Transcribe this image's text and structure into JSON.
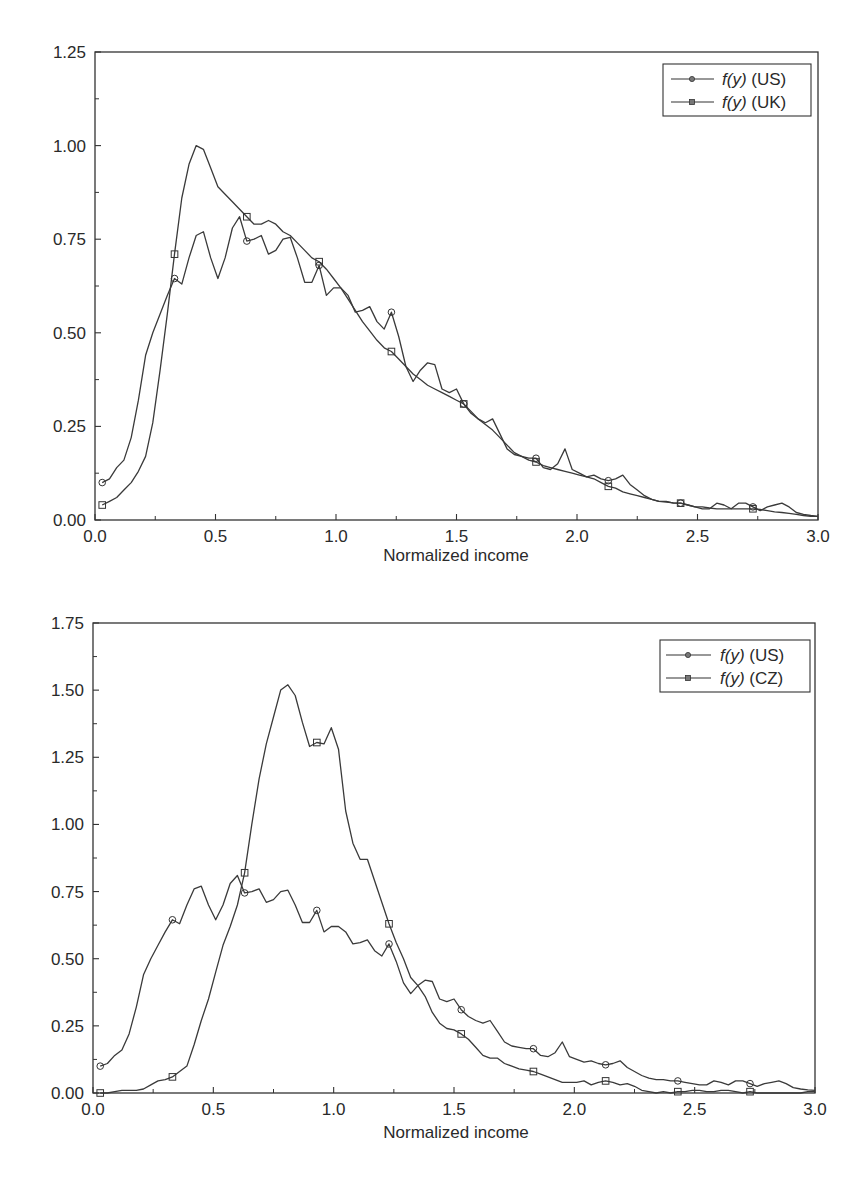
{
  "chart_data": [
    {
      "type": "line",
      "title": "",
      "xlabel": "Normalized income",
      "ylabel": "",
      "xlim": [
        0.0,
        3.0
      ],
      "ylim": [
        0.0,
        1.25
      ],
      "grid": false,
      "legend_position": "upper right",
      "x_ticks": [
        "0.0",
        "0.5",
        "1.0",
        "1.5",
        "2.0",
        "2.5",
        "3.0"
      ],
      "y_ticks": [
        "0.00",
        "0.25",
        "0.50",
        "0.75",
        "1.00",
        "1.25"
      ],
      "marker_x": [
        0.03,
        0.33,
        0.63,
        0.93,
        1.23,
        1.53,
        1.83,
        2.13,
        2.43,
        2.73
      ],
      "series": [
        {
          "name": "f(y) (US)",
          "legend_main": "f(y)",
          "legend_suffix": " (US)",
          "marker": "circle",
          "x": [
            0.03,
            0.06,
            0.09,
            0.12,
            0.15,
            0.18,
            0.21,
            0.24,
            0.27,
            0.3,
            0.33,
            0.36,
            0.39,
            0.42,
            0.45,
            0.48,
            0.51,
            0.54,
            0.57,
            0.6,
            0.63,
            0.66,
            0.69,
            0.72,
            0.75,
            0.78,
            0.81,
            0.84,
            0.87,
            0.9,
            0.93,
            0.96,
            0.99,
            1.02,
            1.05,
            1.08,
            1.11,
            1.14,
            1.17,
            1.2,
            1.23,
            1.26,
            1.29,
            1.32,
            1.35,
            1.38,
            1.41,
            1.44,
            1.47,
            1.5,
            1.53,
            1.56,
            1.59,
            1.62,
            1.65,
            1.68,
            1.71,
            1.74,
            1.77,
            1.8,
            1.83,
            1.86,
            1.89,
            1.92,
            1.95,
            1.98,
            2.01,
            2.04,
            2.07,
            2.1,
            2.13,
            2.16,
            2.19,
            2.22,
            2.25,
            2.28,
            2.31,
            2.34,
            2.37,
            2.4,
            2.43,
            2.46,
            2.49,
            2.52,
            2.55,
            2.58,
            2.61,
            2.64,
            2.67,
            2.7,
            2.73,
            2.76,
            2.79,
            2.82,
            2.85,
            2.88,
            2.91,
            2.94,
            2.97,
            3.0
          ],
          "values": [
            0.1,
            0.11,
            0.14,
            0.16,
            0.22,
            0.32,
            0.44,
            0.5,
            0.55,
            0.6,
            0.645,
            0.63,
            0.7,
            0.76,
            0.77,
            0.7,
            0.645,
            0.7,
            0.78,
            0.81,
            0.745,
            0.75,
            0.76,
            0.71,
            0.72,
            0.75,
            0.755,
            0.7,
            0.635,
            0.635,
            0.68,
            0.6,
            0.62,
            0.62,
            0.6,
            0.555,
            0.56,
            0.57,
            0.53,
            0.51,
            0.555,
            0.49,
            0.41,
            0.37,
            0.4,
            0.42,
            0.415,
            0.35,
            0.34,
            0.35,
            0.31,
            0.285,
            0.27,
            0.26,
            0.27,
            0.23,
            0.19,
            0.175,
            0.17,
            0.165,
            0.165,
            0.14,
            0.135,
            0.15,
            0.19,
            0.135,
            0.125,
            0.115,
            0.12,
            0.11,
            0.105,
            0.11,
            0.12,
            0.095,
            0.08,
            0.065,
            0.055,
            0.05,
            0.05,
            0.045,
            0.045,
            0.04,
            0.035,
            0.03,
            0.03,
            0.045,
            0.04,
            0.03,
            0.045,
            0.045,
            0.035,
            0.025,
            0.035,
            0.04,
            0.045,
            0.035,
            0.02,
            0.015,
            0.012,
            0.01
          ]
        },
        {
          "name": "f(y) (UK)",
          "legend_main": "f(y)",
          "legend_suffix": " (UK)",
          "marker": "square",
          "x": [
            0.03,
            0.06,
            0.09,
            0.12,
            0.15,
            0.18,
            0.21,
            0.24,
            0.27,
            0.3,
            0.33,
            0.36,
            0.39,
            0.42,
            0.45,
            0.48,
            0.51,
            0.54,
            0.57,
            0.6,
            0.63,
            0.66,
            0.69,
            0.72,
            0.75,
            0.78,
            0.81,
            0.84,
            0.87,
            0.9,
            0.93,
            0.96,
            0.99,
            1.02,
            1.05,
            1.08,
            1.11,
            1.14,
            1.17,
            1.2,
            1.23,
            1.26,
            1.29,
            1.32,
            1.35,
            1.38,
            1.41,
            1.44,
            1.47,
            1.5,
            1.53,
            1.56,
            1.59,
            1.62,
            1.65,
            1.68,
            1.71,
            1.74,
            1.77,
            1.8,
            1.83,
            1.86,
            1.89,
            1.92,
            1.95,
            1.98,
            2.01,
            2.04,
            2.07,
            2.1,
            2.13,
            2.16,
            2.19,
            2.22,
            2.25,
            2.28,
            2.31,
            2.34,
            2.37,
            2.4,
            2.43,
            2.46,
            2.49,
            2.52,
            2.55,
            2.58,
            2.61,
            2.64,
            2.67,
            2.7,
            2.73,
            2.76,
            2.79,
            2.82,
            2.85,
            2.88,
            2.91,
            2.94,
            2.97,
            3.0
          ],
          "values": [
            0.04,
            0.05,
            0.06,
            0.08,
            0.1,
            0.13,
            0.17,
            0.26,
            0.4,
            0.55,
            0.71,
            0.86,
            0.95,
            1.0,
            0.99,
            0.94,
            0.89,
            0.87,
            0.85,
            0.83,
            0.81,
            0.79,
            0.79,
            0.8,
            0.79,
            0.77,
            0.76,
            0.74,
            0.72,
            0.7,
            0.69,
            0.67,
            0.645,
            0.62,
            0.59,
            0.56,
            0.53,
            0.505,
            0.48,
            0.46,
            0.45,
            0.43,
            0.41,
            0.39,
            0.375,
            0.36,
            0.35,
            0.34,
            0.33,
            0.32,
            0.31,
            0.29,
            0.27,
            0.255,
            0.24,
            0.22,
            0.2,
            0.18,
            0.17,
            0.16,
            0.155,
            0.145,
            0.14,
            0.135,
            0.13,
            0.125,
            0.12,
            0.115,
            0.11,
            0.1,
            0.09,
            0.085,
            0.075,
            0.07,
            0.065,
            0.06,
            0.055,
            0.05,
            0.048,
            0.046,
            0.045,
            0.04,
            0.035,
            0.035,
            0.032,
            0.03,
            0.03,
            0.03,
            0.03,
            0.03,
            0.03,
            0.028,
            0.025,
            0.022,
            0.02,
            0.018,
            0.015,
            0.012,
            0.01,
            0.01
          ]
        }
      ]
    },
    {
      "type": "line",
      "title": "",
      "xlabel": "Normalized income",
      "ylabel": "",
      "xlim": [
        0.0,
        3.0
      ],
      "ylim": [
        0.0,
        1.75
      ],
      "grid": false,
      "legend_position": "upper right",
      "x_ticks": [
        "0.0",
        "0.5",
        "1.0",
        "1.5",
        "2.0",
        "2.5",
        "3.0"
      ],
      "y_ticks": [
        "0.00",
        "0.25",
        "0.50",
        "0.75",
        "1.00",
        "1.25",
        "1.50",
        "1.75"
      ],
      "marker_x": [
        0.03,
        0.33,
        0.63,
        0.93,
        1.23,
        1.53,
        1.83,
        2.13,
        2.43,
        2.73
      ],
      "series": [
        {
          "name": "f(y) (US)",
          "legend_main": "f(y)",
          "legend_suffix": " (US)",
          "marker": "circle",
          "x": [
            0.03,
            0.06,
            0.09,
            0.12,
            0.15,
            0.18,
            0.21,
            0.24,
            0.27,
            0.3,
            0.33,
            0.36,
            0.39,
            0.42,
            0.45,
            0.48,
            0.51,
            0.54,
            0.57,
            0.6,
            0.63,
            0.66,
            0.69,
            0.72,
            0.75,
            0.78,
            0.81,
            0.84,
            0.87,
            0.9,
            0.93,
            0.96,
            0.99,
            1.02,
            1.05,
            1.08,
            1.11,
            1.14,
            1.17,
            1.2,
            1.23,
            1.26,
            1.29,
            1.32,
            1.35,
            1.38,
            1.41,
            1.44,
            1.47,
            1.5,
            1.53,
            1.56,
            1.59,
            1.62,
            1.65,
            1.68,
            1.71,
            1.74,
            1.77,
            1.8,
            1.83,
            1.86,
            1.89,
            1.92,
            1.95,
            1.98,
            2.01,
            2.04,
            2.07,
            2.1,
            2.13,
            2.16,
            2.19,
            2.22,
            2.25,
            2.28,
            2.31,
            2.34,
            2.37,
            2.4,
            2.43,
            2.46,
            2.49,
            2.52,
            2.55,
            2.58,
            2.61,
            2.64,
            2.67,
            2.7,
            2.73,
            2.76,
            2.79,
            2.82,
            2.85,
            2.88,
            2.91,
            2.94,
            2.97,
            3.0
          ],
          "values": [
            0.1,
            0.11,
            0.14,
            0.16,
            0.22,
            0.32,
            0.44,
            0.5,
            0.55,
            0.6,
            0.645,
            0.63,
            0.7,
            0.76,
            0.77,
            0.7,
            0.645,
            0.7,
            0.78,
            0.81,
            0.745,
            0.75,
            0.76,
            0.71,
            0.72,
            0.75,
            0.755,
            0.7,
            0.635,
            0.635,
            0.68,
            0.6,
            0.62,
            0.62,
            0.6,
            0.555,
            0.56,
            0.57,
            0.53,
            0.51,
            0.555,
            0.49,
            0.41,
            0.37,
            0.4,
            0.42,
            0.415,
            0.35,
            0.34,
            0.35,
            0.31,
            0.285,
            0.27,
            0.26,
            0.27,
            0.23,
            0.19,
            0.175,
            0.17,
            0.165,
            0.165,
            0.14,
            0.135,
            0.15,
            0.19,
            0.135,
            0.125,
            0.115,
            0.12,
            0.11,
            0.105,
            0.11,
            0.12,
            0.095,
            0.08,
            0.065,
            0.055,
            0.05,
            0.05,
            0.045,
            0.045,
            0.04,
            0.035,
            0.03,
            0.03,
            0.045,
            0.04,
            0.03,
            0.045,
            0.045,
            0.035,
            0.025,
            0.035,
            0.04,
            0.045,
            0.035,
            0.02,
            0.015,
            0.012,
            0.01
          ]
        },
        {
          "name": "f(y) (CZ)",
          "legend_main": "f(y)",
          "legend_suffix": " (CZ)",
          "marker": "square",
          "x": [
            0.03,
            0.06,
            0.09,
            0.12,
            0.15,
            0.18,
            0.21,
            0.24,
            0.27,
            0.3,
            0.33,
            0.36,
            0.39,
            0.42,
            0.45,
            0.48,
            0.51,
            0.54,
            0.57,
            0.6,
            0.63,
            0.66,
            0.69,
            0.72,
            0.75,
            0.78,
            0.81,
            0.84,
            0.87,
            0.9,
            0.93,
            0.96,
            0.99,
            1.02,
            1.05,
            1.08,
            1.11,
            1.14,
            1.17,
            1.2,
            1.23,
            1.26,
            1.29,
            1.32,
            1.35,
            1.38,
            1.41,
            1.44,
            1.47,
            1.5,
            1.53,
            1.56,
            1.59,
            1.62,
            1.65,
            1.68,
            1.71,
            1.74,
            1.77,
            1.8,
            1.83,
            1.86,
            1.89,
            1.92,
            1.95,
            1.98,
            2.01,
            2.04,
            2.07,
            2.1,
            2.13,
            2.16,
            2.19,
            2.22,
            2.25,
            2.28,
            2.31,
            2.34,
            2.37,
            2.4,
            2.43,
            2.46,
            2.49,
            2.52,
            2.55,
            2.58,
            2.61,
            2.64,
            2.67,
            2.7,
            2.73,
            2.76,
            2.79,
            2.82,
            2.85,
            2.88,
            2.91,
            2.94,
            2.97,
            3.0
          ],
          "values": [
            0.0,
            0.0,
            0.005,
            0.01,
            0.01,
            0.01,
            0.015,
            0.03,
            0.045,
            0.05,
            0.06,
            0.08,
            0.1,
            0.18,
            0.27,
            0.35,
            0.45,
            0.55,
            0.62,
            0.7,
            0.82,
            1.0,
            1.17,
            1.3,
            1.4,
            1.5,
            1.52,
            1.48,
            1.38,
            1.29,
            1.305,
            1.3,
            1.36,
            1.28,
            1.05,
            0.93,
            0.87,
            0.87,
            0.79,
            0.71,
            0.63,
            0.56,
            0.5,
            0.43,
            0.4,
            0.36,
            0.3,
            0.26,
            0.24,
            0.235,
            0.22,
            0.2,
            0.17,
            0.14,
            0.13,
            0.13,
            0.11,
            0.1,
            0.09,
            0.085,
            0.08,
            0.07,
            0.06,
            0.05,
            0.04,
            0.04,
            0.04,
            0.045,
            0.03,
            0.04,
            0.045,
            0.04,
            0.03,
            0.035,
            0.025,
            0.01,
            0.005,
            0.0,
            0.005,
            0.0,
            0.005,
            0.005,
            0.01,
            0.01,
            0.005,
            0.005,
            0.01,
            0.01,
            0.005,
            0.0,
            0.005,
            0.0,
            0.0,
            0.0,
            0.0,
            0.0,
            0.0,
            0.0,
            0.005,
            0.005
          ]
        }
      ]
    }
  ]
}
